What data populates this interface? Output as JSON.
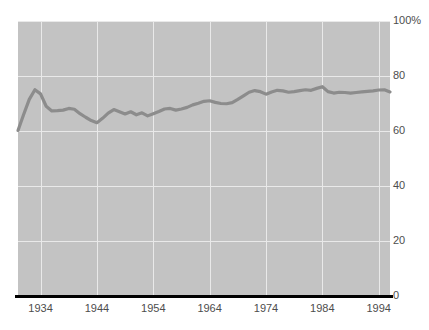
{
  "chart_data": {
    "type": "line",
    "title": "",
    "xlabel": "",
    "ylabel": "",
    "xlim": [
      1930,
      1996
    ],
    "ylim": [
      0,
      100
    ],
    "grid": true,
    "legend": null,
    "axis": {
      "y_ticks": [
        0,
        20,
        40,
        60,
        80,
        100
      ],
      "y_tick_labels": [
        "0",
        "20",
        "40",
        "60",
        "80",
        "100%"
      ],
      "x_ticks": [
        1934,
        1944,
        1954,
        1964,
        1974,
        1984,
        1994
      ],
      "x_tick_labels": [
        "1934",
        "1944",
        "1954",
        "1964",
        "1974",
        "1984",
        "1994"
      ]
    },
    "series": [
      {
        "name": "",
        "color": "#8c8c8c",
        "x": [
          1930,
          1931,
          1932,
          1933,
          1934,
          1935,
          1936,
          1937,
          1938,
          1939,
          1940,
          1941,
          1942,
          1943,
          1944,
          1945,
          1946,
          1947,
          1948,
          1949,
          1950,
          1951,
          1952,
          1953,
          1954,
          1955,
          1956,
          1957,
          1958,
          1959,
          1960,
          1961,
          1962,
          1963,
          1964,
          1965,
          1966,
          1967,
          1968,
          1969,
          1970,
          1971,
          1972,
          1973,
          1974,
          1975,
          1976,
          1977,
          1978,
          1979,
          1980,
          1981,
          1982,
          1983,
          1984,
          1985,
          1986,
          1987,
          1988,
          1989,
          1990,
          1991,
          1992,
          1993,
          1994,
          1995,
          1996
        ],
        "values": [
          60.2,
          66.0,
          71.5,
          75.0,
          73.5,
          69.0,
          67.3,
          67.4,
          67.6,
          68.2,
          67.9,
          66.3,
          65.0,
          63.8,
          63.0,
          64.6,
          66.5,
          67.8,
          67.0,
          66.2,
          67.0,
          65.9,
          66.6,
          65.5,
          66.3,
          67.1,
          68.0,
          68.2,
          67.6,
          68.0,
          68.6,
          69.5,
          70.1,
          70.8,
          71.0,
          70.4,
          70.0,
          69.9,
          70.3,
          71.5,
          72.8,
          74.1,
          74.7,
          74.3,
          73.4,
          74.2,
          74.8,
          74.6,
          74.1,
          74.3,
          74.7,
          75.0,
          74.8,
          75.5,
          76.1,
          74.3,
          73.8,
          74.1,
          74.0,
          73.8,
          74.0,
          74.2,
          74.4,
          74.6,
          74.9,
          75.0,
          74.2
        ]
      }
    ]
  },
  "yticks": [
    {
      "label": "100%",
      "value": 100
    },
    {
      "label": "80",
      "value": 80
    },
    {
      "label": "60",
      "value": 60
    },
    {
      "label": "40",
      "value": 40
    },
    {
      "label": "20",
      "value": 20
    },
    {
      "label": "0",
      "value": 0
    }
  ],
  "xticks": [
    {
      "label": "1934",
      "value": 1934
    },
    {
      "label": "1944",
      "value": 1944
    },
    {
      "label": "1954",
      "value": 1954
    },
    {
      "label": "1964",
      "value": 1964
    },
    {
      "label": "1974",
      "value": 1974
    },
    {
      "label": "1984",
      "value": 1984
    },
    {
      "label": "1994",
      "value": 1994
    }
  ],
  "colors": {
    "plot_background": "#c3c3c3",
    "gridline": "#e9e9e9",
    "line": "#8c8c8c",
    "axis": "#000000",
    "tick_text": "#4d4d4d",
    "page_background": "#ffffff"
  }
}
